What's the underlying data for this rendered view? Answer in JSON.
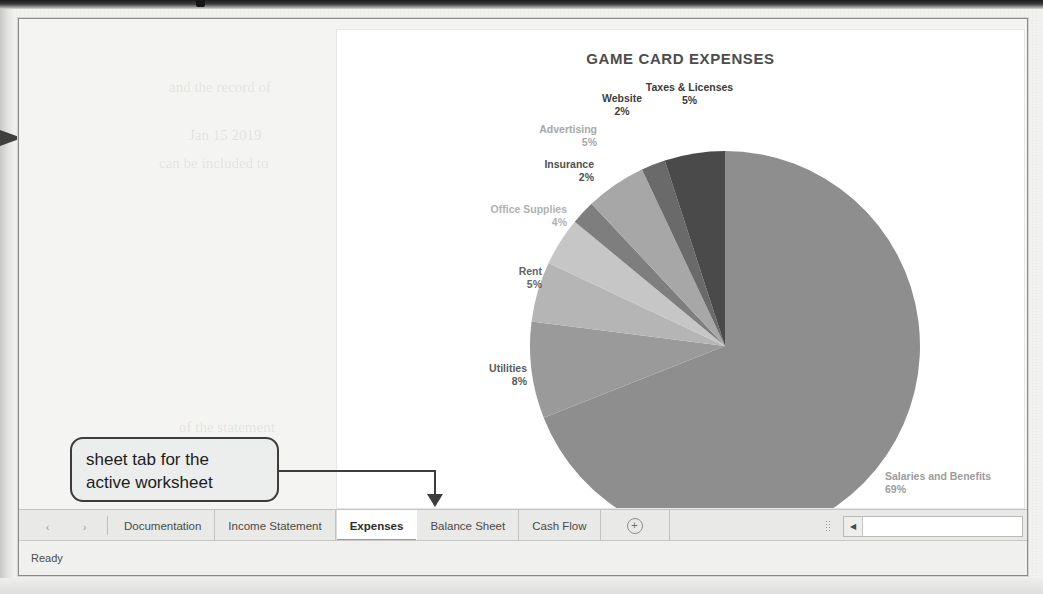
{
  "window": {
    "status_text": "Ready"
  },
  "chart_data": {
    "type": "pie",
    "title": "GAME CARD EXPENSES",
    "legend_position": "none",
    "labels_shown": "category-and-percent",
    "categories": [
      "Salaries and Benefits",
      "Utilities",
      "Rent",
      "Office Supplies",
      "Insurance",
      "Advertising",
      "Website",
      "Taxes & Licenses"
    ],
    "values": [
      69,
      8,
      5,
      4,
      2,
      5,
      2,
      5
    ],
    "percent_labels": [
      "69%",
      "8%",
      "5%",
      "4%",
      "2%",
      "5%",
      "2%",
      "5%"
    ],
    "slice_colors": [
      "#8e8e8e",
      "#9a9a9a",
      "#b5b5b5",
      "#c6c6c6",
      "#7e7e7e",
      "#a7a7a7",
      "#6a6a6a",
      "#4a4a4a"
    ],
    "label_colors": [
      "#9c9c9c",
      "#5a5a5a",
      "#666666",
      "#b0b0b0",
      "#4f4f4f",
      "#a8a8a8",
      "#3f3f3f",
      "#3a3a3a"
    ],
    "xlabel": "",
    "ylabel": ""
  },
  "sheet_tabs": {
    "nav_prev_icon": "chevron-left-icon",
    "nav_next_icon": "chevron-right-icon",
    "add_sheet_label": "+",
    "items": [
      {
        "label": "Documentation",
        "active": false
      },
      {
        "label": "Income Statement",
        "active": false
      },
      {
        "label": "Expenses",
        "active": true
      },
      {
        "label": "Balance Sheet",
        "active": false
      },
      {
        "label": "Cash Flow",
        "active": false
      }
    ]
  },
  "scrollbar": {
    "left_arrow_glyph": "◀"
  },
  "annotation": {
    "callout_text_line1": "sheet tab for the",
    "callout_text_line2": "active worksheet"
  },
  "bleed_text": [
    "and the record of",
    "Jan 15 2019",
    "can be included to",
    "of the statement",
    "a tab for each",
    "the workbook is"
  ]
}
